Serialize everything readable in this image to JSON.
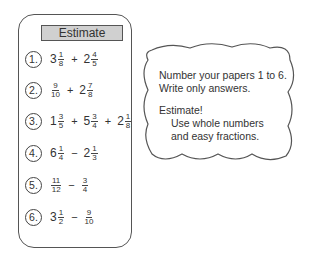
{
  "panel": {
    "title": "Estimate",
    "problems": [
      {
        "label": "1.",
        "terms": [
          {
            "whole": "3",
            "n": "1",
            "d": "8"
          },
          {
            "op": "+"
          },
          {
            "whole": "2",
            "n": "4",
            "d": "5"
          }
        ]
      },
      {
        "label": "2.",
        "terms": [
          {
            "whole": "",
            "n": "9",
            "d": "10"
          },
          {
            "op": "+"
          },
          {
            "whole": "2",
            "n": "7",
            "d": "8"
          }
        ]
      },
      {
        "label": "3.",
        "terms": [
          {
            "whole": "1",
            "n": "3",
            "d": "5"
          },
          {
            "op": "+"
          },
          {
            "whole": "5",
            "n": "3",
            "d": "4"
          },
          {
            "op": "+"
          },
          {
            "whole": "2",
            "n": "1",
            "d": "8"
          }
        ]
      },
      {
        "label": "4.",
        "terms": [
          {
            "whole": "6",
            "n": "1",
            "d": "4"
          },
          {
            "op": "−"
          },
          {
            "whole": "2",
            "n": "1",
            "d": "3"
          }
        ]
      },
      {
        "label": "5.",
        "terms": [
          {
            "whole": "",
            "n": "11",
            "d": "12"
          },
          {
            "op": "−"
          },
          {
            "whole": "",
            "n": "3",
            "d": "4"
          }
        ]
      },
      {
        "label": "6.",
        "terms": [
          {
            "whole": "3",
            "n": "1",
            "d": "2"
          },
          {
            "op": "−"
          },
          {
            "whole": "",
            "n": "9",
            "d": "10"
          }
        ]
      }
    ]
  },
  "instructions": {
    "line1": "Number your papers 1 to 6.",
    "line2": "Write only answers.",
    "line3": "Estimate!",
    "line4": "Use whole numbers",
    "line5": "and easy fractions."
  },
  "colors": {
    "header_bg": "#d0d0d0",
    "stroke": "#555555"
  }
}
